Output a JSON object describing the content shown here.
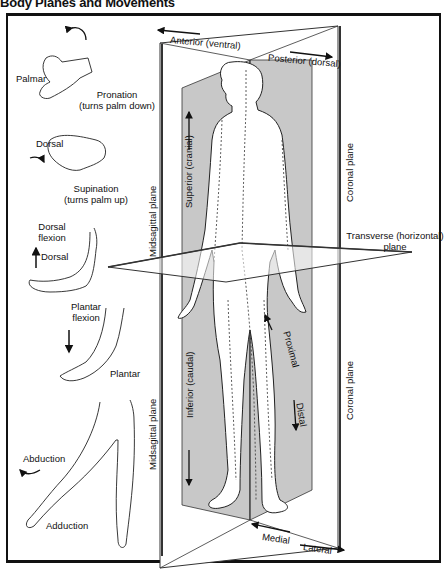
{
  "title": "Body Planes and Movements",
  "planes": {
    "midsagittal_upper": "Midsagittal plane",
    "midsagittal_lower": "Midsagittal plane",
    "coronal_upper": "Coronal plane",
    "coronal_lower": "Coronal plane",
    "transverse_line1": "Transverse (horizontal)",
    "transverse_line2": "plane"
  },
  "directions": {
    "anterior": "Anterior (ventral)",
    "posterior": "Posterior (dorsal)",
    "superior": "Superior (cranial)",
    "inferior": "Inferior (caudal)",
    "proximal": "Proximal",
    "distal": "Distal",
    "medial": "Medial",
    "lateral": "Lateral"
  },
  "movements": {
    "palmar": "Palmar",
    "pronation_line1": "Pronation",
    "pronation_line2": "(turns palm down)",
    "dorsal_hand": "Dorsal",
    "supination_line1": "Supination",
    "supination_line2": "(turns palm up)",
    "dorsal_flexion_line1": "Dorsal",
    "dorsal_flexion_line2": "flexion",
    "dorsal_foot": "Dorsal",
    "plantar_flexion_line1": "Plantar",
    "plantar_flexion_line2": "flexion",
    "plantar": "Plantar",
    "abduction": "Abduction",
    "adduction": "Adduction"
  },
  "colors": {
    "plane_fill": "#c8c8c8",
    "line": "#111111",
    "background": "#ffffff"
  }
}
